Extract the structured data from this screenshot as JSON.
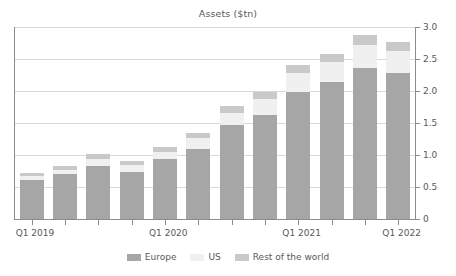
{
  "chart_data": {
    "type": "bar",
    "stacked": true,
    "title": "Assets ($tn)",
    "xlabel": "",
    "ylabel": "",
    "ylim": [
      0,
      3.0
    ],
    "ytick_labels": [
      "0",
      "0.5",
      "1.0",
      "1.5",
      "2.0",
      "2.5",
      "3.0"
    ],
    "ytick_values": [
      0,
      0.5,
      1.0,
      1.5,
      2.0,
      2.5,
      3.0
    ],
    "grid": true,
    "legend_position": "bottom",
    "categories": [
      "Q1 2019",
      "Q2 2019",
      "Q3 2019",
      "Q4 2019",
      "Q1 2020",
      "Q2 2020",
      "Q3 2020",
      "Q4 2020",
      "Q1 2021",
      "Q2 2021",
      "Q3 2021",
      "Q4 2021"
    ],
    "xtick_labels": [
      "Q1 2019",
      "Q1 2020",
      "Q1 2021",
      "Q1 2022"
    ],
    "xtick_label_indices": [
      0,
      4,
      8,
      11
    ],
    "series": [
      {
        "name": "Europe",
        "color": "#a6a6a6",
        "values": [
          0.61,
          0.7,
          0.83,
          0.74,
          0.94,
          1.1,
          1.47,
          1.63,
          1.99,
          2.14,
          2.36,
          2.28
        ]
      },
      {
        "name": "US",
        "color": "#f0f0f0",
        "values": [
          0.06,
          0.07,
          0.11,
          0.1,
          0.11,
          0.16,
          0.19,
          0.24,
          0.29,
          0.31,
          0.36,
          0.35
        ]
      },
      {
        "name": "Rest of the world",
        "color": "#c9c9c9",
        "values": [
          0.05,
          0.06,
          0.07,
          0.07,
          0.08,
          0.09,
          0.11,
          0.12,
          0.13,
          0.13,
          0.16,
          0.14
        ]
      }
    ],
    "totals": [
      0.72,
      0.83,
      1.01,
      0.91,
      1.13,
      1.35,
      1.77,
      1.99,
      2.41,
      2.58,
      2.88,
      2.77
    ]
  },
  "legend": {
    "items": [
      {
        "label": "Europe",
        "color": "#a6a6a6"
      },
      {
        "label": "US",
        "color": "#f0f0f0"
      },
      {
        "label": "Rest of the world",
        "color": "#c9c9c9"
      }
    ]
  },
  "colors": {
    "europe": "#a6a6a6",
    "us": "#f0f0f0",
    "rest_of_world": "#c9c9c9",
    "axis": "#8c8c8c",
    "grid": "#d9d9d9",
    "text": "#595959",
    "background": "#ffffff"
  }
}
